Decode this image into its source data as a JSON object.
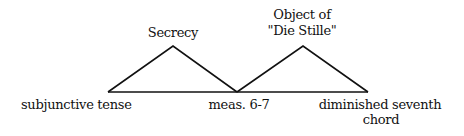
{
  "diagram": {
    "line_color": "#111111",
    "baseline": {
      "x1": 108,
      "x2": 368,
      "y": 92
    },
    "triangles": [
      {
        "label": "Secrecy",
        "left": [
          108,
          92
        ],
        "apex": [
          173,
          46
        ],
        "right": [
          237,
          92
        ]
      },
      {
        "label": "Object of \"Die Stille\"",
        "left": [
          237,
          92
        ],
        "apex": [
          303,
          46
        ],
        "right": [
          368,
          92
        ]
      }
    ],
    "apex_labels": {
      "secrecy": "Secrecy",
      "object_line1": "Object of",
      "object_line2": "\"Die Stille\""
    },
    "base_labels": {
      "left": "subjunctive tense",
      "middle": "meas. 6-7",
      "right_line1": "diminished seventh",
      "right_line2": "chord"
    }
  }
}
